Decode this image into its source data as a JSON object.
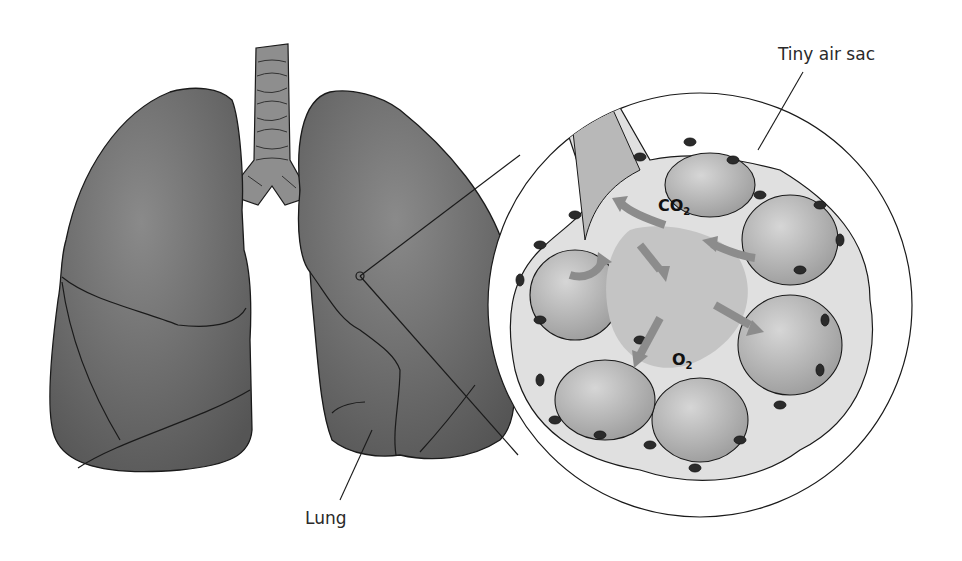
{
  "diagram": {
    "labels": {
      "air_sac": "Tiny air sac",
      "lung": "Lung"
    },
    "gases": {
      "co2_main": "CO",
      "co2_sub": "2",
      "o2_main": "O",
      "o2_sub": "2"
    },
    "colors": {
      "lung_fill": "#6f6f6f",
      "lung_dark": "#4f4f4f",
      "outline": "#1a1a1a",
      "alveolus_fill": "#bdbdbd",
      "membrane": "#e2e2e2",
      "arrow": "#8c8c8c",
      "capillary": "#2b2b2b",
      "background": "#ffffff"
    }
  }
}
